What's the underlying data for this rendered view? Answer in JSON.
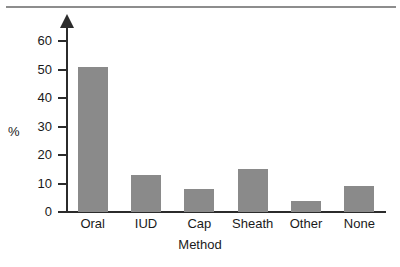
{
  "chart_data": {
    "type": "bar",
    "title": "",
    "xlabel": "Method",
    "ylabel": "%",
    "categories": [
      "Oral",
      "IUD",
      "Cap",
      "Sheath",
      "Other",
      "None"
    ],
    "values": [
      51,
      13,
      8,
      15,
      4,
      9
    ],
    "yticks": [
      0,
      10,
      20,
      30,
      40,
      50,
      60
    ],
    "ytick_labels": [
      "0",
      "10",
      "20",
      "30",
      "40",
      "50",
      "60"
    ],
    "ylim": [
      0,
      65
    ],
    "grid": false,
    "legend": "none",
    "bar_color": "#8a8a8a",
    "axis_color": "#2b2b2b",
    "background_color": "#ffffff"
  },
  "figure": {
    "top_rule_color": "#8d8d8d"
  }
}
